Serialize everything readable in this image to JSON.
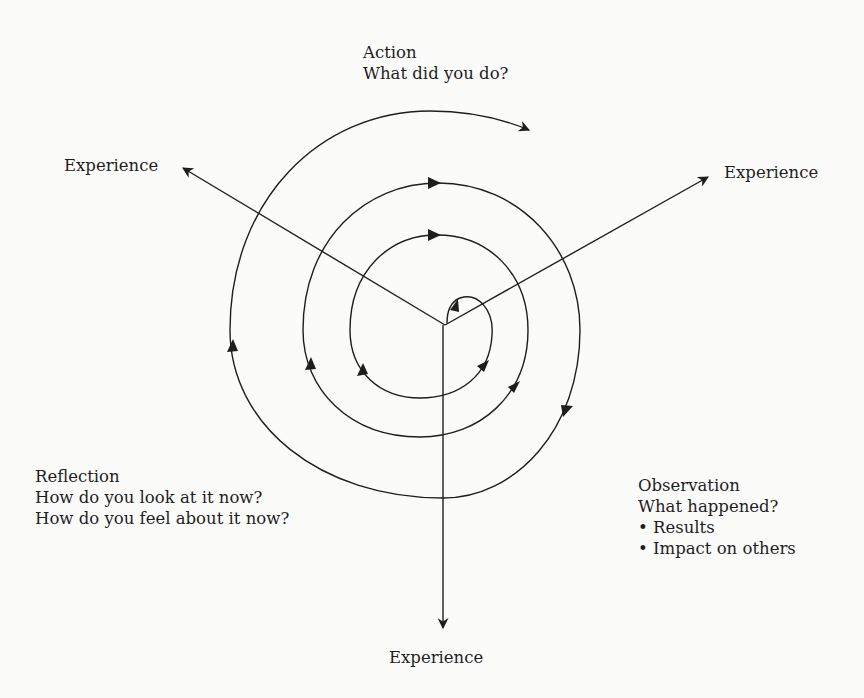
{
  "diagram": {
    "type": "experiential-learning-spiral",
    "stroke_color": "#1e1e1e",
    "background": "#fbfbfa"
  },
  "labels": {
    "action": {
      "title": "Action",
      "lines": [
        "What did you do?"
      ]
    },
    "observation": {
      "title": "Observation",
      "lines": [
        "What happened?",
        "• Results",
        "• Impact on others"
      ]
    },
    "reflection": {
      "title": "Reflection",
      "lines": [
        "How do you look at it now?",
        "How do you feel about it now?"
      ]
    },
    "experience_left": "Experience",
    "experience_right": "Experience",
    "experience_bottom": "Experience"
  }
}
